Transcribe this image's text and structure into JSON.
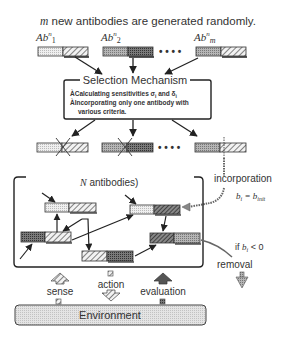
{
  "title": {
    "prefix": "m",
    "text": " new antibodies are generated randomly."
  },
  "new_antibodies": [
    {
      "label_base": "Ab",
      "sup": "n",
      "sub": "1"
    },
    {
      "label_base": "Ab",
      "sup": "n",
      "sub": "2"
    },
    {
      "label_base": "Ab",
      "sup": "n",
      "sub": "m"
    }
  ],
  "ellipsis": "• • • •",
  "selection": {
    "title": "Selection Mechanism",
    "items": [
      "ÀCalculating sensitivities σ",
      "ÀIncorporating only one antibody with",
      "various criteria."
    ],
    "item1_sub_i": "i",
    "item1_and": " and δ",
    "item1_sub_i2": "i"
  },
  "pool": {
    "label_italic": "N",
    "label": " antibodies)"
  },
  "incorporation": {
    "label": "incorporation",
    "formula_b": "b",
    "formula_sub": "i",
    "formula_eq": " = b",
    "formula_sub2": "init"
  },
  "removal": {
    "condition_prefix": "if ",
    "condition_b": "b",
    "condition_sub": "i",
    "condition_rest": " < 0",
    "label": "removal"
  },
  "io": {
    "sense": "sense",
    "action": "action",
    "evaluation": "evaluation"
  },
  "environment": {
    "label": "Environment"
  },
  "colors": {
    "stroke": "#333333",
    "light_fill": "#e6e6e6",
    "mid_fill": "#a8a8a8",
    "dark_fill": "#6e6e6e",
    "env_fill": "#dcdcdc"
  }
}
